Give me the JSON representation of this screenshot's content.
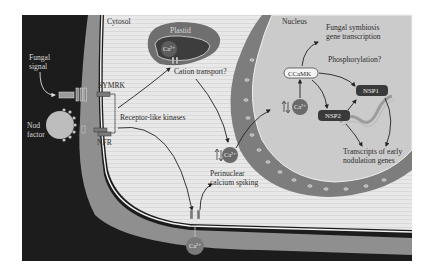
{
  "figure": {
    "regions": {
      "cytosol": "Cytosol",
      "nucleus": "Nucleus",
      "plastid": "Plastid"
    },
    "external_signals": {
      "fungal_signal_line1": "Fungal",
      "fungal_signal_line2": "signal",
      "nod_factor_line1": "Nod",
      "nod_factor_line2": "factor"
    },
    "receptors": {
      "symrk": "SYMRK",
      "nfr": "NFR",
      "receptor_like_kinases": "Receptor-like kinases"
    },
    "ions": {
      "plastid_ca": "Ca²⁺",
      "cytosol_ca": "Ca²⁺",
      "nuclear_ca": "Ca²⁺",
      "external_ca": "Ca²⁺"
    },
    "processes": {
      "cation_transport": "Cation transport?",
      "perinuclear_line1": "Perinuclear",
      "perinuclear_line2": "calcium spiking",
      "phosphorylation": "Phosphorylation?",
      "fungal_symbiosis_line1": "Fungal symbiosis",
      "fungal_symbiosis_line2": "gene transcription",
      "transcripts_line1": "Transcripts of early",
      "transcripts_line2": "nodulation genes"
    },
    "proteins": {
      "ccamk": "CCaMK",
      "nsp1": "NSP1",
      "nsp2": "NSP2"
    },
    "colors": {
      "exterior": "#1c1c1c",
      "cell_wall": "#8f8f8f",
      "cytosol": "#e6e6e6",
      "nucleus": "#c9c9c9",
      "nuclear_envelope": "#7d7d7d",
      "plastid_outer": "#6f6f6f",
      "plastid_inner": "#3d3d3d",
      "calcium": "#6a6a6a",
      "nsp_box": "#3a3a3a"
    }
  }
}
